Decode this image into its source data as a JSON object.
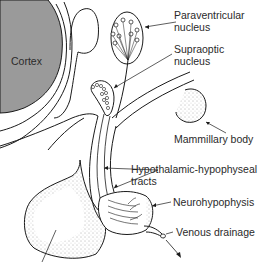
{
  "diagram": {
    "type": "anatomical-illustration",
    "colors": {
      "cortex_fill": "#9a9a9a",
      "line": "#1a1a1a",
      "stipple": "#555555",
      "background": "#ffffff"
    },
    "regions": {
      "cortex": {
        "label": "Cortex"
      }
    },
    "labels": {
      "paraventricular": {
        "line1": "Paraventricular",
        "line2": "nucleus"
      },
      "supraoptic": {
        "line1": "Supraoptic",
        "line2": "nucleus"
      },
      "mammillary": {
        "line1": "Mammillary body"
      },
      "tracts": {
        "line1": "Hypothalamic-hypophyseal",
        "line2": "tracts"
      },
      "neurohypophysis": {
        "line1": "Neurohypophysis"
      },
      "venous": {
        "line1": "Venous drainage"
      }
    }
  }
}
